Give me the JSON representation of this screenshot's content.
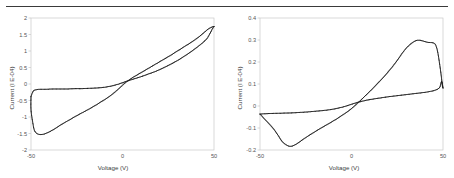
{
  "figure": {
    "has_top_rule": true,
    "background_color": "#ffffff",
    "curve_color": "#1a1a1a",
    "axis_color": "#c9c9c9",
    "tick_text_color": "#555555"
  },
  "chart_data": [
    {
      "type": "line",
      "title": "",
      "xlabel": "Voltage (V)",
      "ylabel": "Current (I E-04)",
      "xlim": [
        -50,
        50
      ],
      "ylim": [
        -2,
        2
      ],
      "xticks": [
        -50,
        0,
        50
      ],
      "xtick_labels": [
        "-50",
        "0",
        "50"
      ],
      "yticks": [
        -2,
        -1.5,
        -1,
        -0.5,
        0,
        0.5,
        1,
        1.5,
        2
      ],
      "ytick_labels": [
        "-2",
        "-1.5",
        "-1",
        "-0.5",
        "0",
        "0.5",
        "1",
        "1.5",
        "2"
      ],
      "grid": false,
      "legend": null,
      "series": [
        {
          "name": "forward-sweep",
          "x": [
            -50,
            -50,
            -49,
            -48,
            -46,
            -44,
            -42,
            -40,
            -38,
            -36,
            -34,
            -32,
            -30,
            -26,
            -22,
            -18,
            -14,
            -10,
            -6,
            -2,
            2,
            6,
            10,
            14,
            18,
            22,
            26,
            30,
            34,
            38,
            42,
            45,
            47,
            49,
            50
          ],
          "y": [
            -0.38,
            -0.78,
            -1.18,
            -1.42,
            -1.52,
            -1.53,
            -1.5,
            -1.45,
            -1.39,
            -1.32,
            -1.25,
            -1.18,
            -1.12,
            -0.99,
            -0.87,
            -0.75,
            -0.62,
            -0.48,
            -0.33,
            -0.14,
            0.06,
            0.21,
            0.34,
            0.47,
            0.6,
            0.73,
            0.86,
            1.0,
            1.14,
            1.28,
            1.44,
            1.58,
            1.67,
            1.73,
            1.74
          ]
        },
        {
          "name": "reverse-sweep",
          "x": [
            50,
            49,
            48,
            47,
            46,
            44,
            42,
            38,
            34,
            30,
            26,
            22,
            18,
            14,
            10,
            6,
            2,
            -2,
            -6,
            -10,
            -14,
            -18,
            -22,
            -26,
            -30,
            -34,
            -38,
            -42,
            -45,
            -47,
            -48.5,
            -49.5,
            -50
          ],
          "y": [
            1.74,
            1.66,
            1.55,
            1.45,
            1.37,
            1.26,
            1.17,
            1.0,
            0.85,
            0.71,
            0.59,
            0.48,
            0.38,
            0.3,
            0.22,
            0.15,
            0.08,
            0.0,
            -0.06,
            -0.1,
            -0.12,
            -0.13,
            -0.14,
            -0.14,
            -0.15,
            -0.15,
            -0.15,
            -0.16,
            -0.16,
            -0.17,
            -0.2,
            -0.3,
            -0.38
          ]
        }
      ]
    },
    {
      "type": "line",
      "title": "",
      "xlabel": "Voltage (V)",
      "ylabel": "Current (I E-04)",
      "xlim": [
        -50,
        50
      ],
      "ylim": [
        -0.2,
        0.4
      ],
      "xticks": [
        -50,
        0,
        50
      ],
      "xtick_labels": [
        "-50",
        "0",
        "50"
      ],
      "yticks": [
        -0.2,
        -0.1,
        0,
        0.1,
        0.2,
        0.3,
        0.4
      ],
      "ytick_labels": [
        "-0.2",
        "-0.1",
        "0",
        "0.1",
        "0.2",
        "0.3",
        "0.4"
      ],
      "grid": false,
      "legend": null,
      "series": [
        {
          "name": "forward-sweep",
          "x": [
            -50,
            -49,
            -48,
            -46,
            -44,
            -42,
            -40,
            -38,
            -36,
            -34,
            -32,
            -30,
            -27,
            -24,
            -20,
            -16,
            -12,
            -8,
            -4,
            0,
            4,
            8,
            12,
            16,
            20,
            24,
            28,
            31,
            34,
            36,
            38,
            40,
            42,
            44,
            45,
            46,
            47,
            48,
            49,
            49.6,
            50
          ],
          "y": [
            -0.037,
            -0.045,
            -0.055,
            -0.072,
            -0.09,
            -0.11,
            -0.135,
            -0.16,
            -0.175,
            -0.183,
            -0.181,
            -0.172,
            -0.155,
            -0.138,
            -0.117,
            -0.097,
            -0.078,
            -0.058,
            -0.036,
            -0.012,
            0.018,
            0.05,
            0.083,
            0.118,
            0.155,
            0.196,
            0.243,
            0.272,
            0.292,
            0.299,
            0.298,
            0.293,
            0.289,
            0.288,
            0.286,
            0.277,
            0.25,
            0.2,
            0.14,
            0.095,
            0.082
          ]
        },
        {
          "name": "reverse-sweep",
          "x": [
            50,
            49.7,
            49.4,
            49.2,
            49,
            48.6,
            48,
            46,
            44,
            40,
            36,
            32,
            28,
            24,
            20,
            16,
            12,
            8,
            4,
            0,
            -4,
            -8,
            -12,
            -16,
            -20,
            -24,
            -28,
            -32,
            -36,
            -40,
            -44,
            -47,
            -49,
            -50
          ],
          "y": [
            0.082,
            0.098,
            0.11,
            0.112,
            0.108,
            0.095,
            0.082,
            0.073,
            0.068,
            0.062,
            0.058,
            0.054,
            0.05,
            0.046,
            0.042,
            0.037,
            0.032,
            0.026,
            0.018,
            0.008,
            -0.003,
            -0.011,
            -0.017,
            -0.021,
            -0.024,
            -0.027,
            -0.029,
            -0.031,
            -0.032,
            -0.033,
            -0.034,
            -0.035,
            -0.036,
            -0.037
          ]
        }
      ]
    }
  ]
}
